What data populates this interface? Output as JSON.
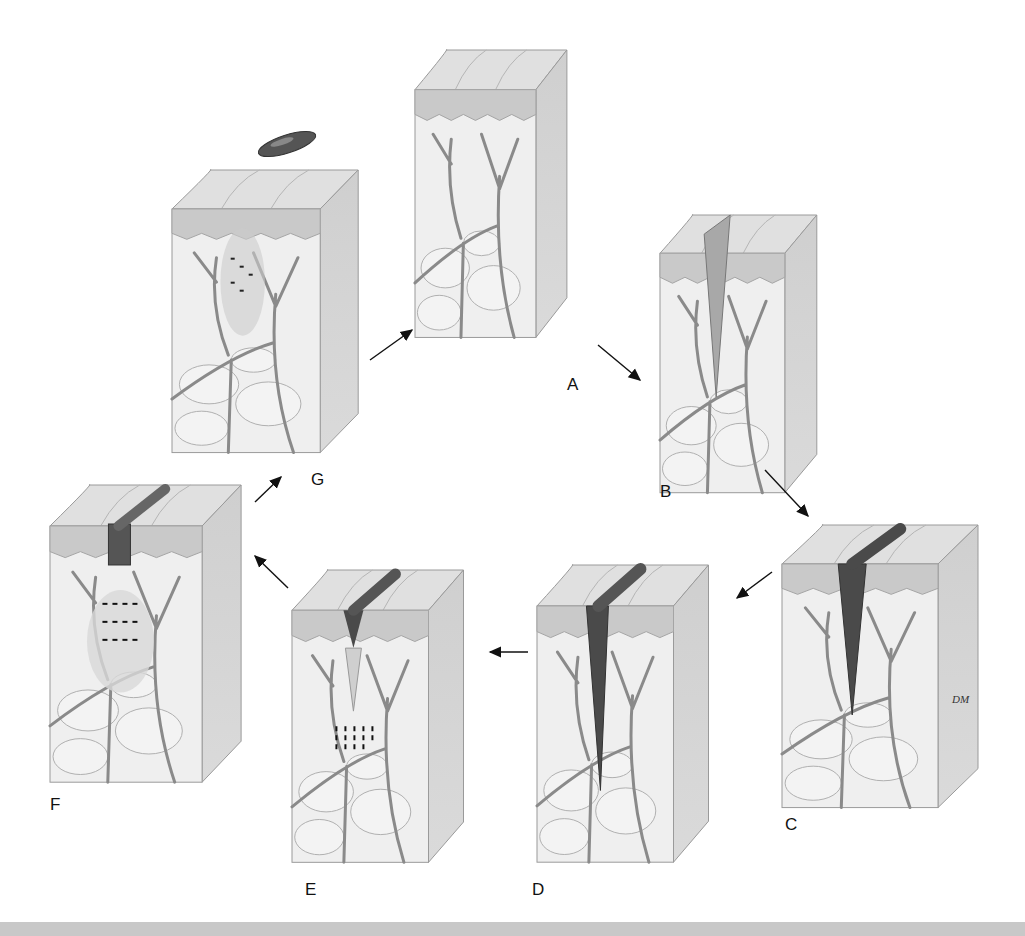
{
  "figure": {
    "panels": [
      {
        "id": "A",
        "label": "A",
        "stage": "intact skin",
        "x": 415,
        "y": 50,
        "w": 155,
        "h": 295,
        "label_x": 567,
        "label_y": 375
      },
      {
        "id": "B",
        "label": "B",
        "stage": "incision with blood cells",
        "x": 660,
        "y": 215,
        "w": 160,
        "h": 285,
        "label_x": 660,
        "label_y": 482
      },
      {
        "id": "C",
        "label": "C",
        "stage": "clot filling wound",
        "x": 782,
        "y": 525,
        "w": 200,
        "h": 290,
        "label_x": 785,
        "label_y": 815
      },
      {
        "id": "D",
        "label": "D",
        "stage": "scab formation, inflammatory cells",
        "x": 537,
        "y": 565,
        "w": 175,
        "h": 305,
        "label_x": 532,
        "label_y": 880
      },
      {
        "id": "E",
        "label": "E",
        "stage": "granulation, cell migration",
        "x": 292,
        "y": 570,
        "w": 175,
        "h": 300,
        "label_x": 305,
        "label_y": 880
      },
      {
        "id": "F",
        "label": "F",
        "stage": "fibroblast proliferation",
        "x": 50,
        "y": 485,
        "w": 195,
        "h": 305,
        "label_x": 50,
        "label_y": 795
      },
      {
        "id": "G",
        "label": "G",
        "stage": "healed with scab shed",
        "x": 172,
        "y": 170,
        "w": 190,
        "h": 290,
        "label_x": 311,
        "label_y": 470
      }
    ],
    "arrows": [
      {
        "from": "G",
        "to": "A",
        "x1": 370,
        "y1": 360,
        "x2": 412,
        "y2": 330
      },
      {
        "from": "A",
        "to": "B",
        "x1": 598,
        "y1": 345,
        "x2": 640,
        "y2": 380
      },
      {
        "from": "B",
        "to": "C",
        "x1": 765,
        "y1": 470,
        "x2": 808,
        "y2": 516
      },
      {
        "from": "C",
        "to": "D",
        "x1": 772,
        "y1": 572,
        "x2": 737,
        "y2": 598
      },
      {
        "from": "D",
        "to": "E",
        "x1": 528,
        "y1": 652,
        "x2": 490,
        "y2": 652
      },
      {
        "from": "E",
        "to": "F",
        "x1": 288,
        "y1": 588,
        "x2": 255,
        "y2": 556
      },
      {
        "from": "F",
        "to": "G",
        "x1": 255,
        "y1": 502,
        "x2": 281,
        "y2": 477
      }
    ],
    "signature": "DM",
    "colors": {
      "epidermis": "#c9c9c9",
      "dermis": "#efefef",
      "vessel": "#8a8a8a",
      "clot": "#4a4a4a",
      "side_face": "#d2d2d2",
      "top_face": "#e0e0e0",
      "outline": "#9a9a9a",
      "band": "#c8c8c8"
    }
  }
}
